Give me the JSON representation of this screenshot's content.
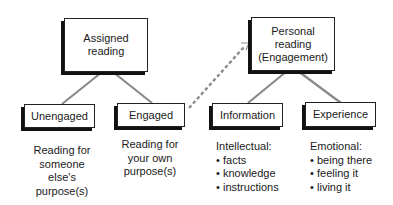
{
  "diagram": {
    "nodes": {
      "assigned_reading": {
        "label": "Assigned\nreading"
      },
      "personal_reading": {
        "label": "Personal\nreading\n(Engagement)"
      },
      "unengaged": {
        "label": "Unengaged"
      },
      "engaged": {
        "label": "Engaged"
      },
      "information": {
        "label": "Information"
      },
      "experience": {
        "label": "Experience"
      }
    },
    "descriptions": {
      "unengaged": {
        "lines": [
          "Reading for",
          "someone",
          "else's",
          "purpose(s)"
        ]
      },
      "engaged": {
        "lines": [
          "Reading for",
          "your own",
          "purpose(s)"
        ]
      },
      "information": {
        "heading": "Intellectual:",
        "bullet_char": "•",
        "items": [
          "facts",
          "knowledge",
          "instructions"
        ]
      },
      "experience": {
        "heading": "Emotional:",
        "bullet_char": "•",
        "items": [
          "being there",
          "feeling it",
          "living it"
        ]
      }
    },
    "edges": [
      {
        "from": "assigned_reading",
        "to": "unengaged",
        "style": "solid"
      },
      {
        "from": "assigned_reading",
        "to": "engaged",
        "style": "solid"
      },
      {
        "from": "personal_reading",
        "to": "information",
        "style": "solid"
      },
      {
        "from": "personal_reading",
        "to": "experience",
        "style": "solid"
      },
      {
        "from": "engaged",
        "to": "personal_reading",
        "style": "dashed-arrow"
      }
    ],
    "colors": {
      "connector": "#8a8a8a",
      "dashed_connector": "#8c8c8c",
      "box_border": "#222222",
      "box_shadow": "#111111"
    }
  }
}
